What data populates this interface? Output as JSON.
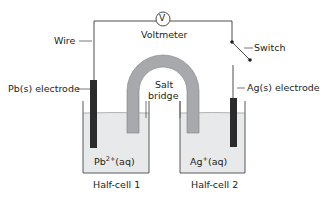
{
  "labels": {
    "wire": "Wire",
    "voltmeter": "Voltmeter",
    "voltmeter_symbol": "V",
    "switch": "Switch",
    "left_electrode": "Pb(s) electrode",
    "right_electrode": "Ag(s) electrode",
    "salt_bridge_line1": "Salt",
    "salt_bridge_line2": "bridge",
    "left_solution_base": "Pb",
    "left_solution_charge": "2+",
    "left_solution_state": "(aq)",
    "right_solution_base": "Ag",
    "right_solution_charge": "+",
    "right_solution_state": "(aq)",
    "left_cell": "Half-cell 1",
    "right_cell": "Half-cell 2"
  },
  "colors": {
    "line": "#231f20",
    "electrode": "#2b2b2b",
    "salt_bridge": "#a7a9ac",
    "solution": "#e8e9ea",
    "beaker_edge": "#58595b"
  }
}
